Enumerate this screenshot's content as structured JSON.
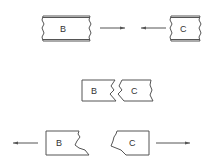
{
  "diagram": {
    "stages": [
      {
        "name": "approach",
        "left_block": {
          "label": "B"
        },
        "right_block": {
          "label": "C"
        },
        "arrows": [
          "right",
          "left"
        ]
      },
      {
        "name": "joined",
        "left_block": {
          "label": "B"
        },
        "right_block": {
          "label": "C"
        }
      },
      {
        "name": "separated",
        "left_block": {
          "label": "B"
        },
        "right_block": {
          "label": "C"
        },
        "arrows": [
          "left",
          "right"
        ]
      }
    ]
  }
}
